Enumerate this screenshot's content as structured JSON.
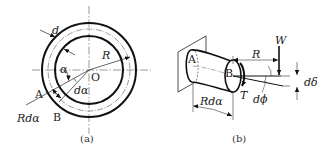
{
  "figure_a": {
    "caption": "(a)",
    "labels": {
      "d": "d",
      "R": "R",
      "alpha": "α",
      "O": "O",
      "A": "A",
      "B": "B",
      "dalpha": "dα",
      "Rdalpha": "Rdα"
    }
  },
  "figure_b": {
    "caption": "(b)",
    "labels": {
      "A": "A",
      "B": "B",
      "R": "R",
      "W": "W",
      "T": "T",
      "dphi": "dϕ",
      "ddelta": "dδ",
      "Rdalpha": "Rdα"
    }
  },
  "colors": {
    "stroke": "#111111",
    "thin": "#444444"
  }
}
